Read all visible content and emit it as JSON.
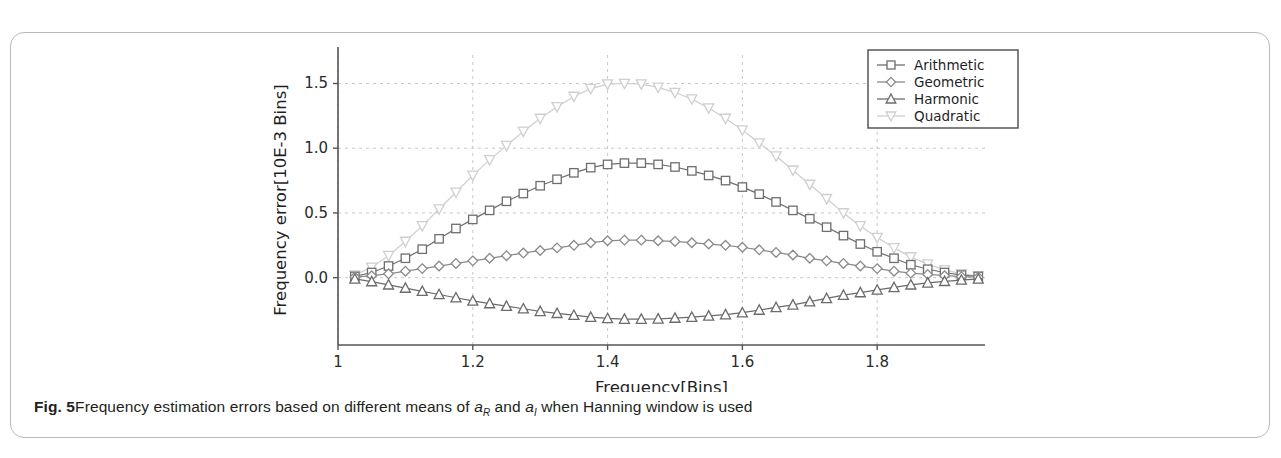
{
  "figure": {
    "label": "Fig. 5",
    "caption_part1": "Frequency estimation errors based on different means of ",
    "caption_sym1": "a",
    "caption_sub1": "R",
    "caption_mid": " and ",
    "caption_sym2": "a",
    "caption_sub2": "I",
    "caption_part2": " when Hanning window is used"
  },
  "chart_data": {
    "type": "line",
    "title": "",
    "xlabel": "Frequency[Bins]",
    "ylabel": "Frequency error[10E-3 Bins]",
    "xlim": [
      1.0,
      1.96
    ],
    "ylim": [
      -0.52,
      1.72
    ],
    "xticks": [
      1,
      1.2,
      1.4,
      1.6,
      1.8
    ],
    "xticklabels": [
      "1",
      "1.2",
      "1.4",
      "1.6",
      "1.8"
    ],
    "yticks": [
      0.0,
      0.5,
      1.0,
      1.5
    ],
    "yticklabels": [
      "0.0",
      "0.5",
      "1.0",
      "1.5"
    ],
    "grid": true,
    "grid_style": "dashed",
    "legend_position": "top-right",
    "x": [
      1.025,
      1.05,
      1.075,
      1.1,
      1.125,
      1.15,
      1.175,
      1.2,
      1.225,
      1.25,
      1.275,
      1.3,
      1.325,
      1.35,
      1.375,
      1.4,
      1.425,
      1.45,
      1.475,
      1.5,
      1.525,
      1.55,
      1.575,
      1.6,
      1.625,
      1.65,
      1.675,
      1.7,
      1.725,
      1.75,
      1.775,
      1.8,
      1.825,
      1.85,
      1.875,
      1.9,
      1.925,
      1.95
    ],
    "series": [
      {
        "name": "Arithmetic",
        "marker": "square",
        "color": "#6e6e6e",
        "values": [
          0.01,
          0.04,
          0.09,
          0.15,
          0.22,
          0.3,
          0.38,
          0.45,
          0.52,
          0.59,
          0.65,
          0.71,
          0.76,
          0.81,
          0.85,
          0.875,
          0.885,
          0.885,
          0.875,
          0.855,
          0.825,
          0.79,
          0.75,
          0.7,
          0.645,
          0.585,
          0.52,
          0.455,
          0.39,
          0.325,
          0.26,
          0.2,
          0.15,
          0.1,
          0.065,
          0.04,
          0.02,
          0.01
        ]
      },
      {
        "name": "Geometric",
        "marker": "diamond",
        "color": "#8a8a8a",
        "values": [
          0.005,
          0.015,
          0.03,
          0.05,
          0.07,
          0.09,
          0.11,
          0.13,
          0.15,
          0.17,
          0.19,
          0.21,
          0.23,
          0.25,
          0.27,
          0.285,
          0.29,
          0.29,
          0.285,
          0.28,
          0.27,
          0.26,
          0.25,
          0.235,
          0.215,
          0.195,
          0.175,
          0.15,
          0.13,
          0.11,
          0.09,
          0.07,
          0.05,
          0.035,
          0.025,
          0.015,
          0.008,
          0.004
        ]
      },
      {
        "name": "Harmonic",
        "marker": "triangle-up",
        "color": "#6b6b6b",
        "values": [
          -0.01,
          -0.03,
          -0.055,
          -0.08,
          -0.105,
          -0.13,
          -0.155,
          -0.18,
          -0.2,
          -0.22,
          -0.24,
          -0.26,
          -0.275,
          -0.29,
          -0.305,
          -0.315,
          -0.32,
          -0.32,
          -0.318,
          -0.312,
          -0.305,
          -0.295,
          -0.285,
          -0.27,
          -0.25,
          -0.23,
          -0.21,
          -0.185,
          -0.16,
          -0.135,
          -0.115,
          -0.095,
          -0.075,
          -0.055,
          -0.04,
          -0.028,
          -0.018,
          -0.01
        ]
      },
      {
        "name": "Quadratic",
        "marker": "triangle-down",
        "color": "#cfcfcf",
        "values": [
          0.02,
          0.08,
          0.17,
          0.28,
          0.4,
          0.53,
          0.66,
          0.79,
          0.91,
          1.02,
          1.13,
          1.23,
          1.32,
          1.4,
          1.46,
          1.495,
          1.5,
          1.495,
          1.47,
          1.43,
          1.38,
          1.31,
          1.23,
          1.14,
          1.04,
          0.94,
          0.83,
          0.72,
          0.61,
          0.5,
          0.4,
          0.31,
          0.23,
          0.16,
          0.105,
          0.06,
          0.03,
          0.012
        ]
      }
    ]
  }
}
